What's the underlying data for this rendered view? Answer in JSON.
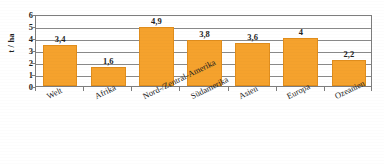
{
  "chart_data": {
    "type": "bar",
    "title": "",
    "xlabel": "",
    "ylabel": "t / ha",
    "ylim": [
      0,
      6
    ],
    "yticks": [
      0,
      1,
      2,
      3,
      4,
      5,
      6
    ],
    "grid": true,
    "legend": null,
    "categories": [
      "Welt",
      "Afrika",
      "Nord-/Zentral-Amerika",
      "Südamerika",
      "Asien",
      "Europa",
      "Ozeanien"
    ],
    "values": [
      3.4,
      1.6,
      4.9,
      3.8,
      3.6,
      4.0,
      2.2
    ],
    "value_labels": [
      "3,4",
      "1,6",
      "4,9",
      "3,8",
      "3,6",
      "4",
      "2,2"
    ],
    "bar_color": "#f5a22d",
    "bar_edge_color": "#e08d1c",
    "grid_color": "#8a8a8a",
    "axis_color": "#7d7d7d"
  }
}
